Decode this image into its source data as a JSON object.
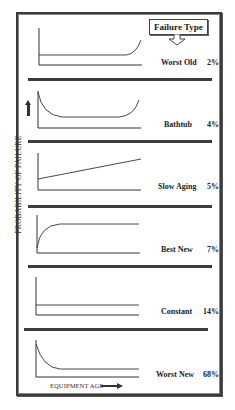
{
  "diagram": {
    "title_box": "Failure Type",
    "y_axis_label": "PROBABILITY OF FAILURE",
    "x_axis_label": "EQUIPMENT AGE",
    "panels": [
      {
        "name": "Worst Old",
        "percent": "2%",
        "curve": "flat-then-rising-end"
      },
      {
        "name": "Bathtub",
        "percent": "4%",
        "curve": "high-start-flat-rising-end"
      },
      {
        "name": "Slow Aging",
        "percent": "5%",
        "curve": "linear-increasing"
      },
      {
        "name": "Best New",
        "percent": "7%",
        "curve": "rising-then-flat"
      },
      {
        "name": "Constant",
        "percent": "14%",
        "curve": "flat"
      },
      {
        "name": "Worst New",
        "percent": "68%",
        "curve": "high-start-decaying-flat"
      }
    ],
    "colors": {
      "line": "#333333",
      "frame": "#3a3a3a",
      "background": "#ffffff"
    }
  }
}
